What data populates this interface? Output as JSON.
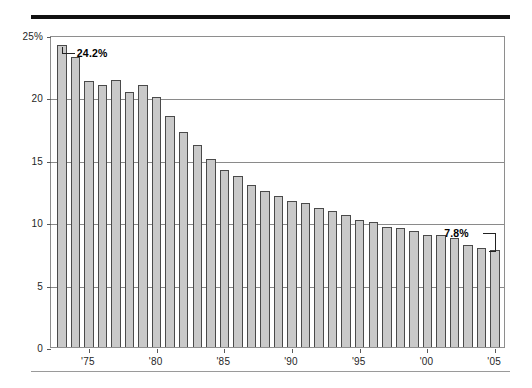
{
  "chart_data": {
    "type": "bar",
    "title": "",
    "subtitle": "",
    "xlabel": "",
    "ylabel": "",
    "ylim": [
      0,
      25
    ],
    "ytick_labels": [
      "25%",
      "20",
      "15",
      "10",
      "5",
      "0"
    ],
    "ytick_values": [
      25,
      20,
      15,
      10,
      5,
      0
    ],
    "xtick_labels": [
      "'75",
      "'80",
      "'85",
      "'90",
      "'95",
      "'00",
      "'05"
    ],
    "xtick_values": [
      1975,
      1980,
      1985,
      1990,
      1995,
      2000,
      2005
    ],
    "grid": true,
    "legend": null,
    "bar_color": "#c9c9c9",
    "bar_edge_color": "#4a4a4a",
    "categories": [
      1973,
      1974,
      1975,
      1976,
      1977,
      1978,
      1979,
      1980,
      1981,
      1982,
      1983,
      1984,
      1985,
      1986,
      1987,
      1988,
      1989,
      1990,
      1991,
      1992,
      1993,
      1994,
      1995,
      1996,
      1997,
      1998,
      1999,
      2000,
      2001,
      2002,
      2003,
      2004,
      2005
    ],
    "values": [
      24.2,
      23.2,
      21.3,
      21.0,
      21.4,
      20.4,
      21.0,
      20.0,
      18.5,
      17.2,
      16.2,
      15.1,
      14.2,
      13.7,
      13.0,
      12.5,
      12.1,
      11.7,
      11.5,
      11.1,
      10.9,
      10.6,
      10.2,
      10.0,
      9.6,
      9.5,
      9.3,
      9.0,
      9.0,
      8.7,
      8.2,
      7.9,
      7.8
    ],
    "annotations": [
      {
        "id": "first-bar",
        "text": "24.2%",
        "category": 1973,
        "value": 24.2
      },
      {
        "id": "last-bar",
        "text": "7.8%",
        "category": 2005,
        "value": 7.8
      }
    ]
  }
}
